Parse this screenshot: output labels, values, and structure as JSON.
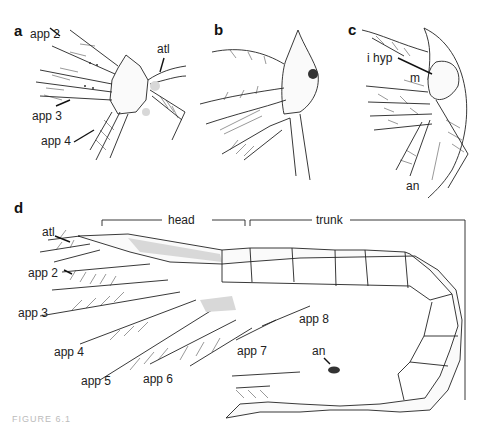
{
  "figure": {
    "caption": "FIGURE 6.1",
    "panels": {
      "a": {
        "letter": "a",
        "labels": {
          "app2": "app 2",
          "app3": "app 3",
          "app4": "app 4",
          "atl": "atl"
        }
      },
      "b": {
        "letter": "b"
      },
      "c": {
        "letter": "c",
        "labels": {
          "ihyp": "i hyp",
          "m": "m",
          "an": "an"
        }
      },
      "d": {
        "letter": "d",
        "labels": {
          "head": "head",
          "trunk": "trunk",
          "atl": "atl",
          "app2": "app 2",
          "app3": "app 3",
          "app4": "app 4",
          "app5": "app 5",
          "app6": "app 6",
          "app7": "app 7",
          "app8": "app 8",
          "an": "an"
        }
      }
    }
  }
}
